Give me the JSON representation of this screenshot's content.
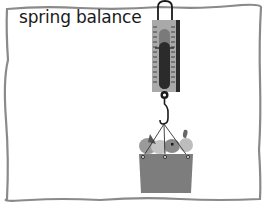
{
  "diagram": {
    "title": "spring balance",
    "colors": {
      "frame_border": "#8a8a8a",
      "background": "#ffffff",
      "scale_body": "#a9a9a9",
      "scale_shadow": "#2a2a2a",
      "scale_window": "#7a7a7a",
      "indicator": "#2b2b2b",
      "basket": "#7d7d7d",
      "fruit": "#b5b5b5",
      "strings": "#333333"
    },
    "components": [
      {
        "name": "spring-balance",
        "label": "spring balance"
      },
      {
        "name": "hook"
      },
      {
        "name": "basket-of-fruit"
      }
    ]
  }
}
